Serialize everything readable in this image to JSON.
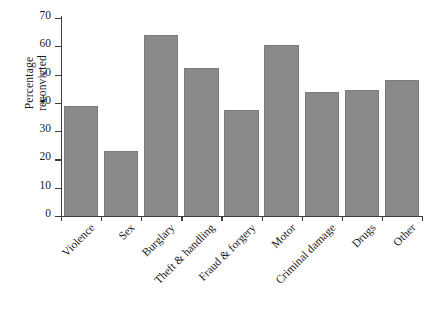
{
  "chart_data": {
    "type": "bar",
    "title": "",
    "subtitle": "",
    "xlabel": "",
    "ylabel": "Percentage reconvicted",
    "ylabel_lines": [
      "Percentage",
      "reconvicted"
    ],
    "categories": [
      "Violence",
      "Sex",
      "Burglary",
      "Theft & handling",
      "Fraud & forgery",
      "Motor",
      "Criminal damage",
      "Drugs",
      "Other"
    ],
    "values": [
      39,
      23,
      64,
      52.5,
      37.5,
      60.5,
      44,
      44.5,
      48
    ],
    "ylim": [
      0,
      70
    ],
    "ytick_labels": [
      "0",
      "10",
      "20",
      "30",
      "40",
      "50",
      "60",
      "70"
    ],
    "ytick_values": [
      0,
      10,
      20,
      30,
      40,
      50,
      60,
      70
    ],
    "grid": false,
    "legend": false,
    "legend_position": "none",
    "bar_color": "#8a8a8a",
    "bar_edge_color": "#7b7b7b",
    "axis_color": "#3d3d3d",
    "background_color": "#ffffff"
  }
}
